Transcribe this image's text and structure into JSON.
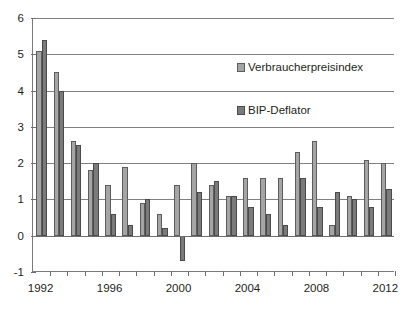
{
  "chart_data": {
    "type": "bar",
    "title": "",
    "subtitle": "",
    "xlabel": "",
    "ylabel": "",
    "ylim": [
      -1,
      6
    ],
    "ytick_values": [
      -1,
      0,
      1,
      2,
      3,
      4,
      5,
      6
    ],
    "ytick_labels": [
      "-1",
      "0",
      "1",
      "2",
      "3",
      "4",
      "5",
      "6"
    ],
    "grid": true,
    "legend_position": "inside-upper-right",
    "categories": [
      1992,
      1993,
      1994,
      1995,
      1996,
      1997,
      1998,
      1999,
      2000,
      2001,
      2002,
      2003,
      2004,
      2005,
      2006,
      2007,
      2008,
      2009,
      2010,
      2011,
      2012
    ],
    "xtick_labels": [
      "1992",
      "1996",
      "2000",
      "2004",
      "2008",
      "2012"
    ],
    "xtick_categories": [
      1992,
      1996,
      2000,
      2004,
      2008,
      2012
    ],
    "series": [
      {
        "name": "Verbraucherpreisindex",
        "color": "#a5a5a5",
        "values": [
          5.1,
          4.5,
          2.6,
          1.8,
          1.4,
          1.9,
          0.9,
          0.6,
          1.4,
          2.0,
          1.4,
          1.1,
          1.6,
          1.6,
          1.6,
          2.3,
          2.6,
          0.3,
          1.1,
          2.1,
          2.0
        ]
      },
      {
        "name": "BIP-Deflator",
        "color": "#7b7b7b",
        "values": [
          5.4,
          4.0,
          2.5,
          2.0,
          0.6,
          0.3,
          1.0,
          0.2,
          -0.7,
          1.2,
          1.5,
          1.1,
          0.8,
          0.6,
          0.3,
          1.6,
          0.8,
          1.2,
          1.0,
          0.8,
          1.3
        ]
      }
    ]
  }
}
